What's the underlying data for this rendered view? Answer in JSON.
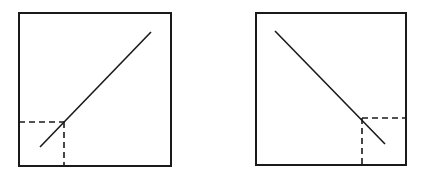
{
  "figure": {
    "background": "#ffffff",
    "stroke_color": "#1a1a1a",
    "panels": [
      {
        "id": "left",
        "description": "Positive slope line with dashed projection to lower-left corner",
        "frame": {
          "x1": 19,
          "y1": 13,
          "x2": 171,
          "y2": 166
        },
        "line": {
          "x1": 40,
          "y1": 147,
          "x2": 151,
          "y2": 32
        },
        "dashed_h": {
          "x1": 19,
          "y1": 122,
          "x2": 64,
          "y2": 122
        },
        "dashed_v": {
          "x1": 64,
          "y1": 122,
          "x2": 64,
          "y2": 166
        }
      },
      {
        "id": "right",
        "description": "Negative slope line with dashed projection to lower-right corner",
        "frame": {
          "x1": 256,
          "y1": 13,
          "x2": 406,
          "y2": 165
        },
        "line": {
          "x1": 275,
          "y1": 31,
          "x2": 385,
          "y2": 144
        },
        "dashed_h": {
          "x1": 362,
          "y1": 118,
          "x2": 406,
          "y2": 118
        },
        "dashed_v": {
          "x1": 362,
          "y1": 118,
          "x2": 362,
          "y2": 165
        }
      }
    ]
  }
}
